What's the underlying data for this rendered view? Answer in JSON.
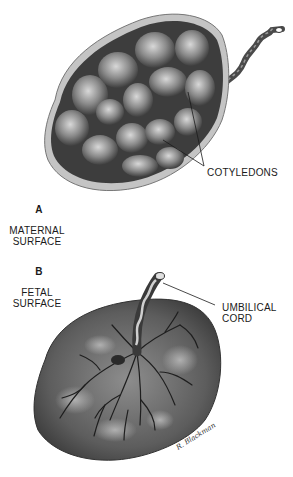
{
  "figure": {
    "panel_a": {
      "letter": "A",
      "caption_line1": "MATERNAL",
      "caption_line2": "SURFACE",
      "callout": "COTYLEDONS"
    },
    "panel_b": {
      "letter": "B",
      "caption_line1": "FETAL",
      "caption_line2": "SURFACE",
      "callout_line1": "UMBILICAL",
      "callout_line2": "CORD"
    },
    "signature": "R. Blackman"
  },
  "colors": {
    "background": "#ffffff",
    "tissue_dark": "#3a3a3a",
    "tissue_mid": "#6b6b6b",
    "tissue_light": "#b5b5b5",
    "rim": "#c9c9c9",
    "vessels": "#1e1e1e",
    "text": "#1a1a1a"
  }
}
